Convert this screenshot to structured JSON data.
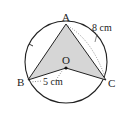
{
  "diagram": {
    "type": "geometry",
    "points": {
      "A": {
        "label": "A"
      },
      "B": {
        "label": "B"
      },
      "C": {
        "label": "C"
      },
      "O": {
        "label": "O"
      }
    },
    "measurements": {
      "AC": "8 cm",
      "BO": "5 cm"
    },
    "colors": {
      "shade": "#d6d6d6",
      "stroke": "#222222",
      "dotted": "#777777"
    }
  }
}
